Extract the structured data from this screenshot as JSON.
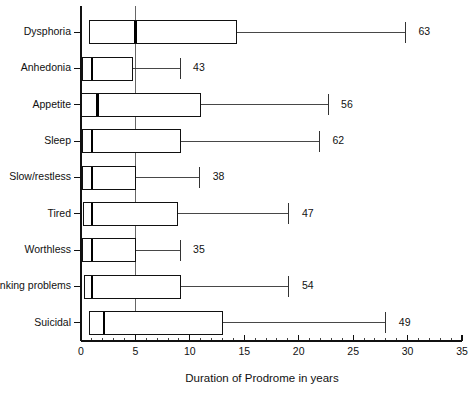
{
  "chart_data": {
    "type": "box",
    "title": "",
    "xlabel": "Duration of Prodrome in years",
    "ylabel": "",
    "xlim": [
      0,
      35
    ],
    "xticks": [
      0,
      5,
      10,
      15,
      20,
      25,
      30,
      35
    ],
    "xtick_labels": [
      "0",
      "5",
      "10",
      "15",
      "20",
      "25",
      "30",
      "35"
    ],
    "minor_tick_step": 1,
    "grid": false,
    "reference_line_x": 5,
    "orientation": "horizontal",
    "categories": [
      "Dysphoria",
      "Anhedonia",
      "Appetite",
      "Sleep",
      "Slow/restless",
      "Tired",
      "Worthless",
      "Thinking problems",
      "Suicidal"
    ],
    "boxes": [
      {
        "category": "Dysphoria",
        "q1": 0.8,
        "median": 5.0,
        "q3": 14.3,
        "whisker_low": 0.8,
        "whisker_high": 29.8,
        "n": 63,
        "n_label": "63"
      },
      {
        "category": "Anhedonia",
        "q1": 0.1,
        "median": 1.0,
        "q3": 4.7,
        "whisker_low": 0.1,
        "whisker_high": 9.1,
        "n": 43,
        "n_label": "43"
      },
      {
        "category": "Appetite",
        "q1": 0.0,
        "median": 1.5,
        "q3": 11.0,
        "whisker_low": 0.0,
        "whisker_high": 22.7,
        "n": 56,
        "n_label": "56"
      },
      {
        "category": "Sleep",
        "q1": 0.1,
        "median": 1.0,
        "q3": 9.1,
        "whisker_low": 0.1,
        "whisker_high": 21.9,
        "n": 62,
        "n_label": "62"
      },
      {
        "category": "Slow/restless",
        "q1": 0.1,
        "median": 1.0,
        "q3": 5.0,
        "whisker_low": 0.1,
        "whisker_high": 10.9,
        "n": 38,
        "n_label": "38"
      },
      {
        "category": "Tired",
        "q1": 0.2,
        "median": 1.0,
        "q3": 8.9,
        "whisker_low": 0.2,
        "whisker_high": 19.1,
        "n": 47,
        "n_label": "47"
      },
      {
        "category": "Worthless",
        "q1": 0.1,
        "median": 1.0,
        "q3": 5.0,
        "whisker_low": 0.1,
        "whisker_high": 9.1,
        "n": 35,
        "n_label": "35"
      },
      {
        "category": "Thinking problems",
        "q1": 0.3,
        "median": 1.0,
        "q3": 9.1,
        "whisker_low": 0.3,
        "whisker_high": 19.1,
        "n": 54,
        "n_label": "54"
      },
      {
        "category": "Suicidal",
        "q1": 0.8,
        "median": 2.1,
        "q3": 13.0,
        "whisker_low": 0.8,
        "whisker_high": 28.0,
        "n": 49,
        "n_label": "49"
      }
    ],
    "colors": {
      "box_stroke": "#111111",
      "median": "#000000",
      "whisker": "#333333",
      "axis": "#111111",
      "background": "#ffffff"
    }
  }
}
